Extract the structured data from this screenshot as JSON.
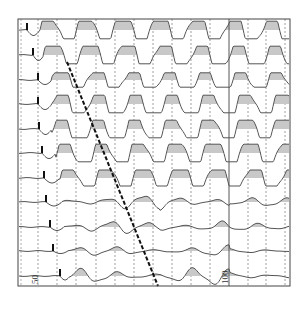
{
  "figure": {
    "fill_color": "#c8c8c8",
    "line_color": "#555555",
    "grid_color": "#777777",
    "moveout_color": "#111111",
    "x_labels": [
      {
        "text": "50",
        "x": 32
      },
      {
        "text": "100",
        "x": 222
      }
    ]
  },
  "chart_data": {
    "type": "line",
    "title": "",
    "xlabel": "",
    "ylabel": "",
    "x_tick_labels": [
      "50",
      "100"
    ],
    "frame": {
      "x0": 18,
      "y0": 19,
      "x1": 290,
      "y1": 286
    },
    "grid_x": [
      38,
      57,
      76,
      96,
      115,
      134,
      153,
      172,
      191,
      210,
      248,
      266,
      285
    ],
    "reference_line_x": 229,
    "moveout_line": {
      "x1": 67,
      "y1": 62,
      "x2": 158,
      "y2": 286
    },
    "traces": [
      {
        "baseline": 30,
        "pick_x": 27,
        "amp": 11,
        "onset": 40,
        "period": 37,
        "clip": true,
        "damp": 1.0
      },
      {
        "baseline": 55,
        "pick_x": 33,
        "amp": 11,
        "onset": 44,
        "period": 37,
        "clip": true,
        "damp": 1.0
      },
      {
        "baseline": 80,
        "pick_x": 38,
        "amp": 9,
        "onset": 52,
        "period": 36,
        "clip": true,
        "damp": 1.0
      },
      {
        "baseline": 104,
        "pick_x": 38,
        "amp": 11,
        "onset": 52,
        "period": 37,
        "clip": true,
        "damp": 1.0
      },
      {
        "baseline": 129,
        "pick_x": 39,
        "amp": 11,
        "onset": 52,
        "period": 37,
        "clip": true,
        "damp": 1.0
      },
      {
        "baseline": 153,
        "pick_x": 42,
        "amp": 11,
        "onset": 56,
        "period": 37,
        "clip": true,
        "damp": 1.0
      },
      {
        "baseline": 178,
        "pick_x": 44,
        "amp": 10,
        "onset": 60,
        "period": 37,
        "clip": true,
        "damp": 0.9
      },
      {
        "baseline": 202,
        "pick_x": 46,
        "amp": 8,
        "onset": 62,
        "period": 36,
        "clip": false,
        "damp": 0.5
      },
      {
        "baseline": 227,
        "pick_x": 50,
        "amp": 7,
        "onset": 64,
        "period": 37,
        "clip": false,
        "damp": 0.45
      },
      {
        "baseline": 251,
        "pick_x": 53,
        "amp": 5,
        "onset": 68,
        "period": 38,
        "clip": false,
        "damp": 0.4
      },
      {
        "baseline": 276,
        "pick_x": 60,
        "amp": 8,
        "onset": 70,
        "period": 38,
        "clip": false,
        "damp": 0.5
      }
    ]
  }
}
